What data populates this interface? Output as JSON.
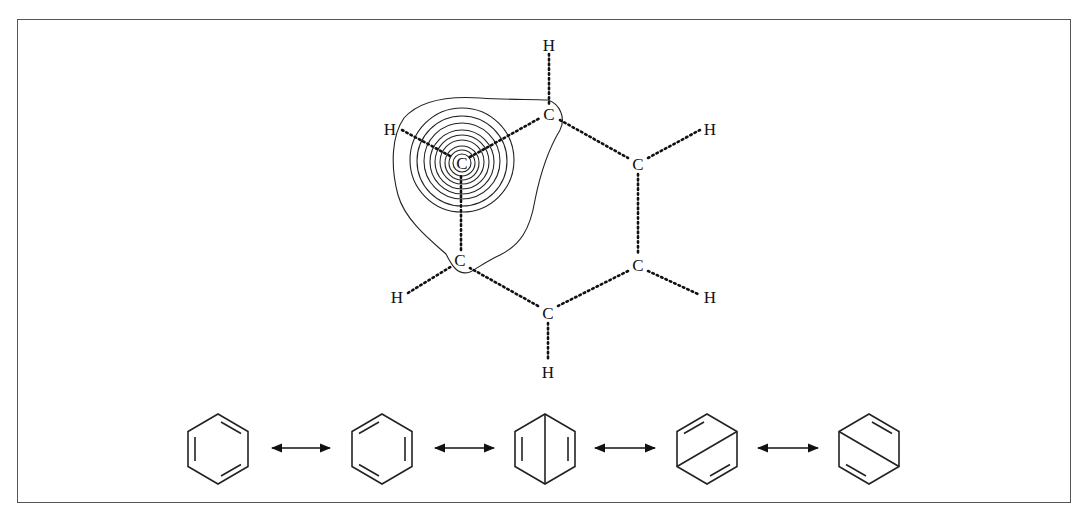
{
  "figure": {
    "colors": {
      "ink": "#111111",
      "frame": "#555555",
      "background": "#ffffff"
    },
    "molecule": {
      "atoms": [
        {
          "id": "C1",
          "label": "C",
          "x": 462,
          "y": 163,
          "note": "central carbon with density contours"
        },
        {
          "id": "C2",
          "label": "C",
          "x": 549,
          "y": 114
        },
        {
          "id": "C3",
          "label": "C",
          "x": 638,
          "y": 164
        },
        {
          "id": "C4",
          "label": "C",
          "x": 638,
          "y": 265
        },
        {
          "id": "C5",
          "label": "C",
          "x": 548,
          "y": 313
        },
        {
          "id": "C6",
          "label": "C",
          "x": 460,
          "y": 260
        },
        {
          "id": "H1",
          "label": "H",
          "x": 390,
          "y": 129
        },
        {
          "id": "H2",
          "label": "H",
          "x": 549,
          "y": 45
        },
        {
          "id": "H3",
          "label": "H",
          "x": 710,
          "y": 129
        },
        {
          "id": "H4",
          "label": "H",
          "x": 710,
          "y": 297
        },
        {
          "id": "H5",
          "label": "H",
          "x": 548,
          "y": 372
        },
        {
          "id": "H6",
          "label": "H",
          "x": 397,
          "y": 297
        }
      ],
      "bond_style": "dotted",
      "contour_count": 10
    },
    "resonance": {
      "structures": [
        {
          "name": "kekule-1",
          "description": "benzene Kekulé structure A"
        },
        {
          "name": "kekule-2",
          "description": "benzene Kekulé structure B"
        },
        {
          "name": "dewar-1",
          "description": "Dewar benzene, vertical para bond"
        },
        {
          "name": "dewar-2",
          "description": "Dewar benzene, diagonal para bond (rising)"
        },
        {
          "name": "dewar-3",
          "description": "Dewar benzene, diagonal para bond (falling)"
        }
      ],
      "connector": "double-headed-arrow",
      "connector_count": 4
    }
  }
}
